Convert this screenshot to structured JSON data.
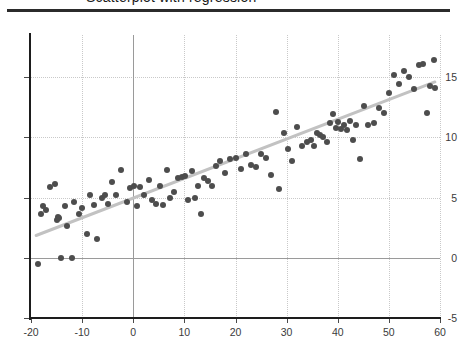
{
  "header": {
    "title_clipped": "Scatterplot with regression",
    "rule_color": "#2b2b2b"
  },
  "chart_data": {
    "type": "scatter",
    "title": "",
    "xlabel": "",
    "ylabel": "",
    "xlim": [
      -20,
      60
    ],
    "ylim": [
      -5,
      18.5
    ],
    "xticks": [
      -20,
      -10,
      0,
      10,
      20,
      30,
      40,
      50,
      60
    ],
    "yticks": [
      -5,
      0,
      5,
      10,
      15
    ],
    "xtick_labels": [
      "-20",
      "-10",
      "0",
      "10",
      "20",
      "30",
      "40",
      "50",
      "60"
    ],
    "ytick_labels": [
      "-5",
      "0",
      "5",
      "10",
      "15"
    ],
    "grid": true,
    "grid_style": "dotted",
    "legend": null,
    "point_color": "#4d4d4d",
    "point_size": 6,
    "fit_line": {
      "type": "linear",
      "color": "#c2c2c2",
      "width": 3,
      "x0": -19.0,
      "y0": 1.85,
      "x1": 59.0,
      "y1": 14.6
    },
    "reference_lines": [
      {
        "axis": "x",
        "value": 0,
        "color": "#9a9a9a"
      },
      {
        "axis": "y",
        "value": 0,
        "color": "#9a9a9a"
      }
    ],
    "points": [
      [
        -18.6,
        -0.5
      ],
      [
        -18.0,
        3.6
      ],
      [
        -17.6,
        4.3
      ],
      [
        -17.0,
        4.0
      ],
      [
        -16.2,
        5.9
      ],
      [
        -15.4,
        6.1
      ],
      [
        -15.0,
        3.1
      ],
      [
        -14.8,
        3.4
      ],
      [
        -14.6,
        3.3
      ],
      [
        -14.2,
        0.0
      ],
      [
        -13.4,
        4.3
      ],
      [
        -13.0,
        2.6
      ],
      [
        -12.0,
        0.0
      ],
      [
        -11.5,
        4.6
      ],
      [
        -10.6,
        3.6
      ],
      [
        -10.0,
        4.1
      ],
      [
        -9.0,
        2.0
      ],
      [
        -8.4,
        5.2
      ],
      [
        -7.6,
        4.4
      ],
      [
        -7.0,
        1.6
      ],
      [
        -6.2,
        5.0
      ],
      [
        -5.6,
        5.2
      ],
      [
        -5.0,
        4.5
      ],
      [
        -4.2,
        6.3
      ],
      [
        -3.4,
        5.2
      ],
      [
        -2.4,
        7.3
      ],
      [
        -1.2,
        4.6
      ],
      [
        -0.6,
        5.8
      ],
      [
        0.2,
        6.0
      ],
      [
        0.8,
        4.3
      ],
      [
        1.4,
        5.9
      ],
      [
        2.2,
        5.2
      ],
      [
        3.0,
        6.5
      ],
      [
        3.6,
        4.8
      ],
      [
        4.4,
        4.5
      ],
      [
        5.2,
        6.0
      ],
      [
        5.8,
        4.4
      ],
      [
        6.6,
        7.3
      ],
      [
        7.2,
        5.0
      ],
      [
        8.0,
        5.5
      ],
      [
        8.8,
        6.6
      ],
      [
        9.6,
        6.7
      ],
      [
        10.2,
        6.8
      ],
      [
        10.8,
        4.8
      ],
      [
        11.4,
        7.2
      ],
      [
        12.0,
        5.0
      ],
      [
        12.6,
        6.0
      ],
      [
        13.2,
        3.6
      ],
      [
        13.8,
        6.6
      ],
      [
        14.6,
        6.4
      ],
      [
        15.4,
        6.0
      ],
      [
        16.2,
        7.6
      ],
      [
        17.0,
        8.0
      ],
      [
        18.0,
        7.0
      ],
      [
        19.0,
        8.2
      ],
      [
        20.0,
        8.3
      ],
      [
        21.0,
        7.4
      ],
      [
        22.0,
        8.6
      ],
      [
        23.0,
        7.7
      ],
      [
        24.0,
        7.5
      ],
      [
        25.0,
        8.6
      ],
      [
        26.0,
        8.3
      ],
      [
        27.0,
        6.9
      ],
      [
        28.0,
        12.1
      ],
      [
        28.6,
        5.7
      ],
      [
        29.4,
        10.4
      ],
      [
        30.2,
        9.0
      ],
      [
        31.0,
        8.0
      ],
      [
        32.0,
        10.9
      ],
      [
        33.0,
        9.3
      ],
      [
        34.0,
        9.6
      ],
      [
        34.8,
        9.8
      ],
      [
        35.4,
        9.3
      ],
      [
        36.0,
        10.4
      ],
      [
        36.6,
        10.2
      ],
      [
        37.2,
        10.0
      ],
      [
        37.8,
        9.6
      ],
      [
        38.4,
        11.2
      ],
      [
        39.0,
        11.9
      ],
      [
        39.6,
        10.8
      ],
      [
        40.0,
        11.3
      ],
      [
        40.6,
        10.7
      ],
      [
        41.2,
        11.0
      ],
      [
        41.8,
        10.6
      ],
      [
        42.4,
        11.4
      ],
      [
        43.0,
        9.8
      ],
      [
        43.6,
        11.0
      ],
      [
        44.4,
        8.2
      ],
      [
        45.2,
        12.6
      ],
      [
        46.0,
        11.0
      ],
      [
        47.0,
        11.2
      ],
      [
        48.0,
        12.4
      ],
      [
        49.0,
        12.0
      ],
      [
        50.0,
        13.7
      ],
      [
        51.0,
        15.2
      ],
      [
        52.0,
        14.4
      ],
      [
        53.0,
        15.5
      ],
      [
        54.0,
        15.0
      ],
      [
        55.0,
        14.0
      ],
      [
        55.8,
        16.0
      ],
      [
        56.6,
        16.1
      ],
      [
        57.4,
        12.0
      ],
      [
        58.0,
        14.3
      ],
      [
        58.8,
        16.4
      ],
      [
        59.0,
        14.1
      ]
    ]
  }
}
